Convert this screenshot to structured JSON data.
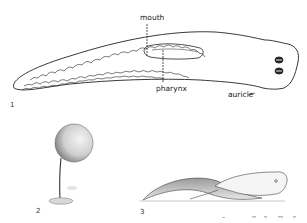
{
  "figures": [
    {
      "number": "1",
      "subject": "planarian-dorsal-view",
      "labels": {
        "mouth": "mouth",
        "pharynx": "pharynx",
        "auricle": "auricle"
      }
    },
    {
      "number": "2",
      "subject": "planarian-spherical-form-on-stalk"
    },
    {
      "number": "3",
      "subject": "planarian-gliding-side-view"
    }
  ],
  "colors": {
    "line": "#222222",
    "background": "#ffffff",
    "shade": "#9a9a9a"
  }
}
